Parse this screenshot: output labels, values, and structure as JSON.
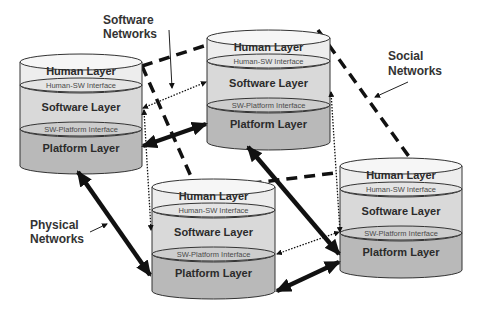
{
  "diagram": {
    "nodes": [
      {
        "id": "A",
        "human_layer": "Human Layer",
        "human_sw_interface": "Human-SW Interface",
        "software_layer": "Software Layer",
        "sw_platform_interface": "SW-Platform Interface",
        "platform_layer": "Platform Layer"
      },
      {
        "id": "B",
        "human_layer": "Human Layer",
        "human_sw_interface": "Human-SW Interface",
        "software_layer": "Software Layer",
        "sw_platform_interface": "SW-Platform Interface",
        "platform_layer": "Platform Layer"
      },
      {
        "id": "C",
        "human_layer": "Human Layer",
        "human_sw_interface": "Human-SW Interface",
        "software_layer": "Software Layer",
        "sw_platform_interface": "SW-Platform Interface",
        "platform_layer": "Platform Layer"
      },
      {
        "id": "D",
        "human_layer": "Human Layer",
        "human_sw_interface": "Human-SW Interface",
        "software_layer": "Software Layer",
        "sw_platform_interface": "SW-Platform Interface",
        "platform_layer": "Platform Layer"
      }
    ],
    "network_labels": {
      "software": [
        "Software",
        "Networks"
      ],
      "social": [
        "Social",
        "Networks"
      ],
      "physical": [
        "Physical",
        "Networks"
      ]
    },
    "edges": {
      "social": [
        [
          "A",
          "B"
        ],
        [
          "A",
          "D"
        ],
        [
          "B",
          "D"
        ],
        [
          "C",
          "D"
        ]
      ],
      "software": [
        [
          "A",
          "B"
        ],
        [
          "A",
          "C"
        ],
        [
          "B",
          "D"
        ],
        [
          "C",
          "D"
        ]
      ],
      "physical": [
        [
          "A",
          "B"
        ],
        [
          "A",
          "C"
        ],
        [
          "B",
          "D"
        ],
        [
          "C",
          "D"
        ]
      ]
    },
    "colors": {
      "human_layer": "#ededed",
      "software_layer": "#d9d9d9",
      "platform_layer": "#b9b9b9",
      "outline": "#333333",
      "edge": "#111111"
    }
  }
}
